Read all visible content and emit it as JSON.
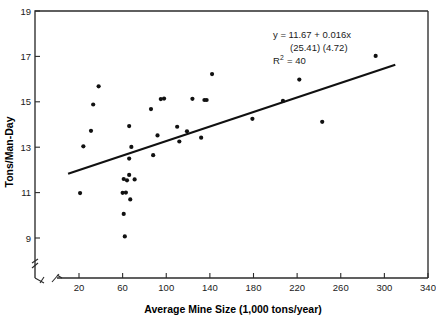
{
  "chart_data": {
    "type": "scatter",
    "title": "",
    "xlabel": "Average Mine Size (1,000 tons/year)",
    "ylabel": "Tons/Man-Day",
    "xlim": [
      0,
      340
    ],
    "ylim": [
      8,
      19
    ],
    "grid": false,
    "legend": "none",
    "xticks": [
      20,
      60,
      100,
      140,
      180,
      220,
      260,
      300,
      340
    ],
    "xtick_labels": [
      "20",
      "60",
      "100",
      "140",
      "180",
      "220",
      "260",
      "300",
      "340"
    ],
    "yticks": [
      9,
      11,
      13,
      15,
      17,
      19
    ],
    "ytick_labels": [
      "9",
      "11",
      "13",
      "15",
      "17",
      "19"
    ],
    "axis_break_x": true,
    "axis_break_y": true,
    "points": [
      [
        21,
        10.98
      ],
      [
        24,
        13.04
      ],
      [
        31,
        13.72
      ],
      [
        33,
        14.88
      ],
      [
        38,
        15.68
      ],
      [
        60,
        10.99
      ],
      [
        61,
        10.06
      ],
      [
        61,
        11.6
      ],
      [
        62,
        9.07
      ],
      [
        63,
        11.0
      ],
      [
        64,
        11.54
      ],
      [
        66,
        12.5
      ],
      [
        66,
        11.78
      ],
      [
        66,
        13.93
      ],
      [
        67,
        10.7
      ],
      [
        68,
        13.01
      ],
      [
        71,
        11.58
      ],
      [
        86,
        14.68
      ],
      [
        88,
        12.65
      ],
      [
        92,
        13.52
      ],
      [
        95,
        15.12
      ],
      [
        98,
        15.14
      ],
      [
        110,
        13.9
      ],
      [
        112,
        13.25
      ],
      [
        119,
        13.7
      ],
      [
        124,
        15.13
      ],
      [
        132,
        13.42
      ],
      [
        135,
        15.08
      ],
      [
        137,
        15.08
      ],
      [
        142,
        16.22
      ],
      [
        179,
        14.25
      ],
      [
        207,
        15.04
      ],
      [
        222,
        15.98
      ],
      [
        243,
        14.12
      ],
      [
        292,
        17.02
      ]
    ],
    "fit_line": {
      "equation": "y = 11.67 + 0.016x",
      "intercept": 11.67,
      "slope": 0.016,
      "x_start": 10,
      "x_end": 310
    },
    "annotations": {
      "equation": "y  =  11.67  +  0.016x",
      "std_errors": "(25.41)    (4.72)",
      "r_squared_prefix": "R",
      "r_squared_exponent": "2",
      "r_squared_value": "=  40"
    }
  },
  "colors": {
    "point": "#111111",
    "line": "#111111",
    "axis": "#2b2b2b",
    "text": "#1a1a1a",
    "background": "#ffffff"
  }
}
